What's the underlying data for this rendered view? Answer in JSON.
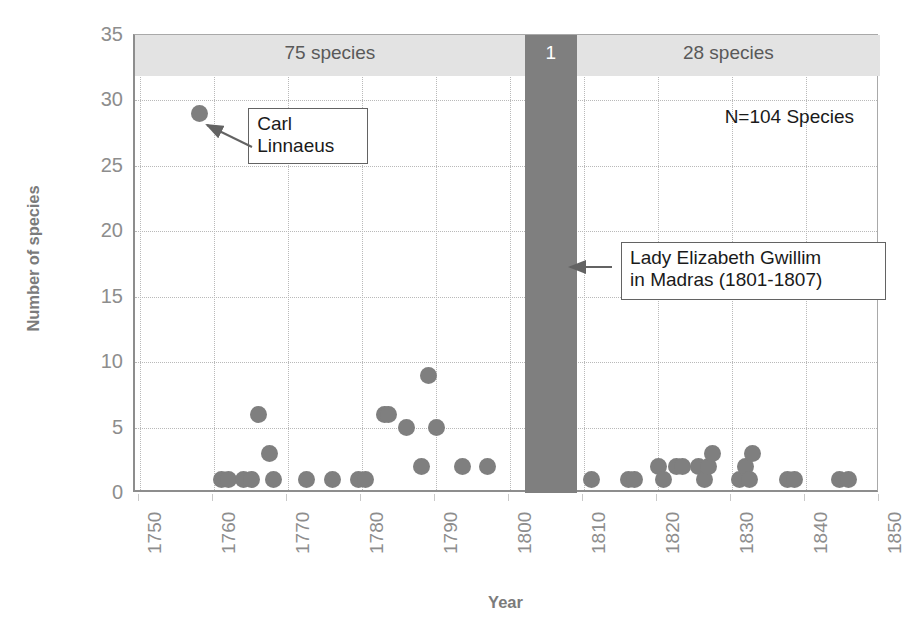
{
  "chart_data": {
    "type": "scatter",
    "title": "",
    "xlabel": "Year",
    "ylabel": "Number of species",
    "xlim": [
      1749.3,
      1850
    ],
    "ylim": [
      0,
      35
    ],
    "xticks": [
      "1750",
      "1760",
      "1770",
      "1780",
      "1790",
      "1800",
      "1810",
      "1820",
      "1830",
      "1840",
      "1850"
    ],
    "xtick_values": [
      1750,
      1760,
      1770,
      1780,
      1790,
      1800,
      1810,
      1820,
      1830,
      1840,
      1850
    ],
    "yticks": [
      "0",
      "5",
      "10",
      "15",
      "20",
      "25",
      "30",
      "35"
    ],
    "ytick_values": [
      0,
      5,
      10,
      15,
      20,
      25,
      30,
      35
    ],
    "grid": true,
    "legend": "none",
    "marker_color": "#7f7f7f",
    "points": [
      {
        "x": 1758.0,
        "y": 29
      },
      {
        "x": 1761.0,
        "y": 1
      },
      {
        "x": 1762.0,
        "y": 1
      },
      {
        "x": 1764.0,
        "y": 1
      },
      {
        "x": 1765.0,
        "y": 1
      },
      {
        "x": 1766.0,
        "y": 6
      },
      {
        "x": 1767.5,
        "y": 3
      },
      {
        "x": 1768.0,
        "y": 1
      },
      {
        "x": 1772.5,
        "y": 1
      },
      {
        "x": 1776.0,
        "y": 1
      },
      {
        "x": 1779.5,
        "y": 1
      },
      {
        "x": 1780.5,
        "y": 1
      },
      {
        "x": 1783.0,
        "y": 6
      },
      {
        "x": 1783.5,
        "y": 6
      },
      {
        "x": 1786.0,
        "y": 5
      },
      {
        "x": 1788.0,
        "y": 2
      },
      {
        "x": 1789.0,
        "y": 9
      },
      {
        "x": 1790.0,
        "y": 5
      },
      {
        "x": 1793.5,
        "y": 2
      },
      {
        "x": 1797.0,
        "y": 2
      },
      {
        "x": 1811.0,
        "y": 1
      },
      {
        "x": 1816.0,
        "y": 1
      },
      {
        "x": 1816.8,
        "y": 1
      },
      {
        "x": 1820.0,
        "y": 2
      },
      {
        "x": 1820.8,
        "y": 1
      },
      {
        "x": 1822.5,
        "y": 2
      },
      {
        "x": 1823.3,
        "y": 2
      },
      {
        "x": 1825.5,
        "y": 2
      },
      {
        "x": 1826.3,
        "y": 1
      },
      {
        "x": 1826.8,
        "y": 2
      },
      {
        "x": 1827.3,
        "y": 3
      },
      {
        "x": 1831.0,
        "y": 1
      },
      {
        "x": 1831.8,
        "y": 2
      },
      {
        "x": 1832.3,
        "y": 1
      },
      {
        "x": 1832.8,
        "y": 3
      },
      {
        "x": 1837.5,
        "y": 1
      },
      {
        "x": 1838.5,
        "y": 1
      },
      {
        "x": 1844.5,
        "y": 1
      },
      {
        "x": 1845.8,
        "y": 1
      }
    ],
    "bands": [
      {
        "id": "left",
        "label": "75 species",
        "x_start": 1749.3,
        "x_end": 1802.0,
        "color": "#e3e3e3"
      },
      {
        "id": "middle",
        "label": "1",
        "x_start": 1802.0,
        "x_end": 1809.0,
        "color": "#7f7f7f"
      },
      {
        "id": "right",
        "label": "28 species",
        "x_start": 1809.0,
        "x_end": 1850.0,
        "color": "#e3e3e3"
      }
    ],
    "annotations": [
      {
        "id": "carl-linnaeus",
        "text": "Carl\nLinnaeus",
        "points_to_x": 1758.0,
        "points_to_y": 29
      },
      {
        "id": "lady-gwillim",
        "text": "Lady Elizabeth Gwillim\nin Madras (1801-1807)",
        "points_to_x": 1806.0,
        "points_to_y": 16.5
      }
    ],
    "total_label": "N=104 Species"
  }
}
